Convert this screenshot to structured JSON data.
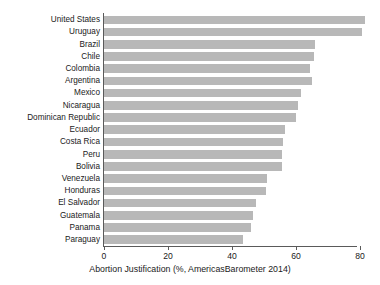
{
  "chart_data": {
    "type": "bar",
    "orientation": "horizontal",
    "title": "",
    "xlabel": "Abortion Justification (%, AmericasBarometer 2014)",
    "ylabel": "",
    "xlim": [
      0,
      84
    ],
    "xticks": [
      0,
      20,
      40,
      60,
      80
    ],
    "xtick_labels": [
      "0",
      "20",
      "40",
      "60",
      "80"
    ],
    "grid": false,
    "legend": null,
    "bar_color": "#b8b8b8",
    "axis_color": "#5a5a5a",
    "background": "#ffffff",
    "categories": [
      "United States",
      "Uruguay",
      "Brazil",
      "Chile",
      "Colombia",
      "Argentina",
      "Mexico",
      "Nicaragua",
      "Dominican Republic",
      "Ecuador",
      "Costa Rica",
      "Peru",
      "Bolivia",
      "Venezuela",
      "Honduras",
      "El Salvador",
      "Guatemala",
      "Panama",
      "Paraguay"
    ],
    "values": [
      81.5,
      80.5,
      66.0,
      65.5,
      64.5,
      65.0,
      61.5,
      60.5,
      60.0,
      56.5,
      56.0,
      55.5,
      55.5,
      51.0,
      50.5,
      47.5,
      46.5,
      46.0,
      43.5
    ]
  }
}
